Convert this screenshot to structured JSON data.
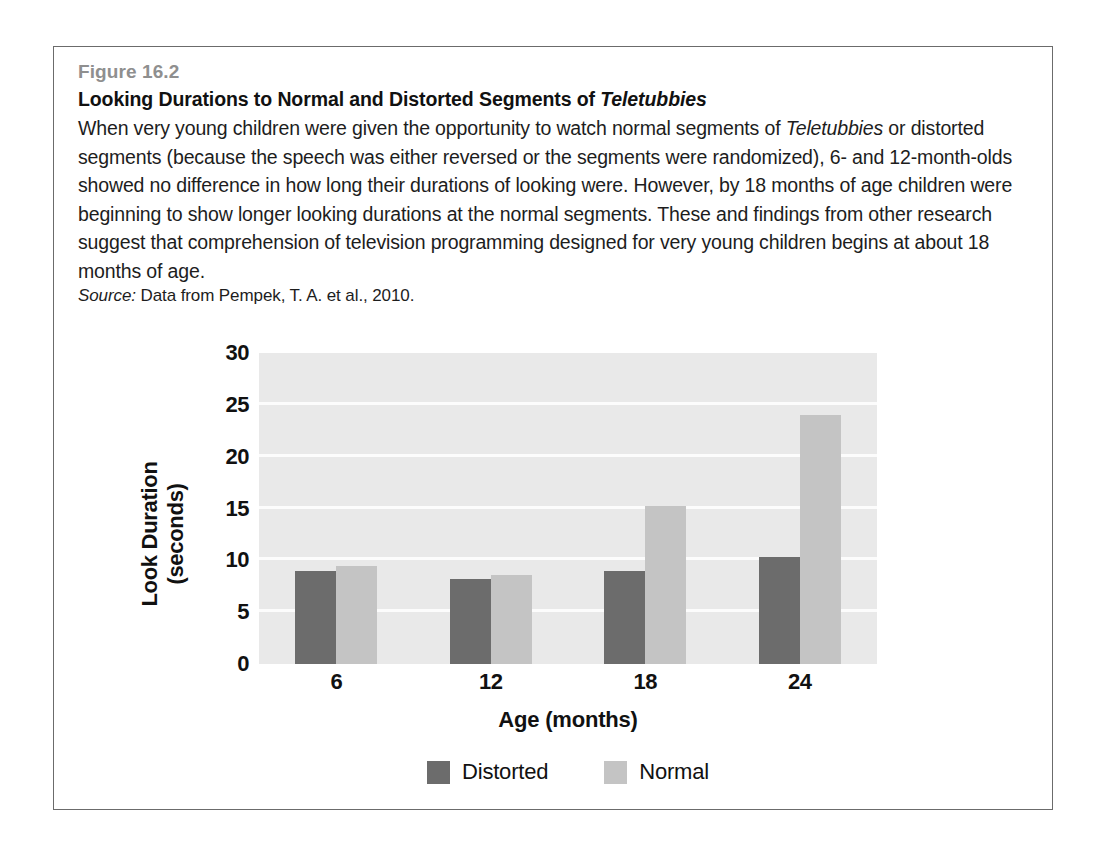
{
  "figure": {
    "number": "Figure 16.2",
    "title_before_italic": "Looking Durations to Normal and Distorted Segments of ",
    "title_italic": "Teletubbies",
    "body_part1": "When very young children were given the opportunity to watch normal segments of ",
    "body_italic": "Teletubbies",
    "body_part2": " or distorted segments (because the speech was either reversed or the segments were randomized), 6- and 12-month-olds showed no difference in how long their durations of looking were. However, by 18 months of age children were beginning to show longer looking durations at the normal segments. These and findings from other research suggest that comprehension of television programming designed for very young children begins at about 18 months of age.",
    "source_label": "Source:",
    "source_text": " Data from Pempek, T. A. et al., 2010."
  },
  "chart_data": {
    "type": "bar",
    "title": "",
    "xlabel": "Age  (months)",
    "ylabel": "Look Duration (seconds)",
    "categories": [
      "6",
      "12",
      "18",
      "24"
    ],
    "series": [
      {
        "name": "Distorted",
        "color": "#6c6c6c",
        "values": [
          9.0,
          8.2,
          9.0,
          10.3
        ]
      },
      {
        "name": "Normal",
        "color": "#c4c4c4",
        "values": [
          9.5,
          8.6,
          15.2,
          24.0
        ]
      }
    ],
    "ylim": [
      0,
      30
    ],
    "yticks": [
      0,
      5,
      10,
      15,
      20,
      25,
      30
    ],
    "ytick_labels": [
      "0",
      "5",
      "10",
      "15",
      "20",
      "25",
      "30"
    ],
    "grid": true,
    "legend_position": "bottom",
    "plot_background": "#e9e9e9",
    "gridline_color": "#fcfcfc"
  }
}
